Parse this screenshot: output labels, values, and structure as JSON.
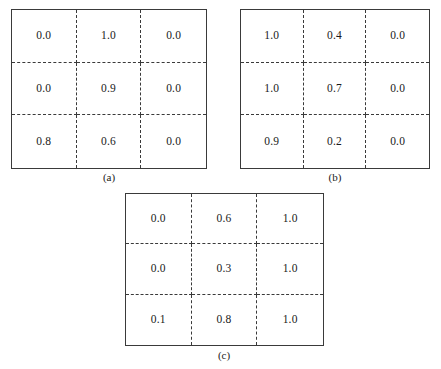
{
  "figure": {
    "type": "three-panel-grid-figure",
    "background_color": "#ffffff",
    "line_color": "#3a3a3a",
    "text_color": "#1a1a1a"
  },
  "panels": [
    {
      "id": "a",
      "label": "(a)",
      "rows": 3,
      "cols": 3,
      "values": [
        [
          "0.0",
          "1.0",
          "0.0"
        ],
        [
          "0.0",
          "0.9",
          "0.0"
        ],
        [
          "0.8",
          "0.6",
          "0.0"
        ]
      ]
    },
    {
      "id": "b",
      "label": "(b)",
      "rows": 3,
      "cols": 3,
      "values": [
        [
          "1.0",
          "0.4",
          "0.0"
        ],
        [
          "1.0",
          "0.7",
          "0.0"
        ],
        [
          "0.9",
          "0.2",
          "0.0"
        ]
      ]
    },
    {
      "id": "c",
      "label": "(c)",
      "rows": 3,
      "cols": 3,
      "values": [
        [
          "0.0",
          "0.6",
          "1.0"
        ],
        [
          "0.0",
          "0.3",
          "1.0"
        ],
        [
          "0.1",
          "0.8",
          "1.0"
        ]
      ]
    }
  ],
  "chart_data": {
    "type": "heatmap",
    "title": "",
    "xlabel": "",
    "ylabel": "",
    "grid": true,
    "legend": "none",
    "subplots": [
      {
        "name": "(a)",
        "rows": 3,
        "cols": 3,
        "values": [
          [
            0.0,
            1.0,
            0.0
          ],
          [
            0.0,
            0.9,
            0.0
          ],
          [
            0.8,
            0.6,
            0.0
          ]
        ],
        "vmin": 0.0,
        "vmax": 1.0
      },
      {
        "name": "(b)",
        "rows": 3,
        "cols": 3,
        "values": [
          [
            1.0,
            0.4,
            0.0
          ],
          [
            1.0,
            0.7,
            0.0
          ],
          [
            0.9,
            0.2,
            0.0
          ]
        ],
        "vmin": 0.0,
        "vmax": 1.0
      },
      {
        "name": "(c)",
        "rows": 3,
        "cols": 3,
        "values": [
          [
            0.0,
            0.6,
            1.0
          ],
          [
            0.0,
            0.3,
            1.0
          ],
          [
            0.1,
            0.8,
            1.0
          ]
        ],
        "vmin": 0.0,
        "vmax": 1.0
      }
    ]
  }
}
